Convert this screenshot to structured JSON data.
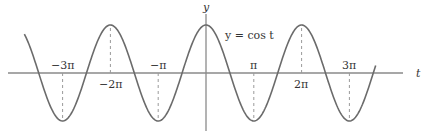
{
  "chart_data": {
    "type": "line",
    "title": "",
    "equation_label": "y = cos t",
    "xlabel": "t",
    "ylabel": "y",
    "function": "cos",
    "x_range_radians": [
      -3.8,
      3.55
    ],
    "ylim": [
      -1,
      1
    ],
    "grid": false,
    "tick_labels_above_axis": [
      {
        "label": "−3π",
        "x_multiple_of_pi": -3
      },
      {
        "label": "−π",
        "x_multiple_of_pi": -1
      },
      {
        "label": "π",
        "x_multiple_of_pi": 1
      },
      {
        "label": "3π",
        "x_multiple_of_pi": 3
      }
    ],
    "tick_labels_below_axis": [
      {
        "label": "−2π",
        "x_multiple_of_pi": -2
      },
      {
        "label": "2π",
        "x_multiple_of_pi": 2
      }
    ],
    "dashed_guides_at_multiple_of_pi": [
      -3,
      -2,
      -1,
      1,
      2,
      3
    ],
    "colors": {
      "curve": "#6b6b6b",
      "axes": "#8a8a8a",
      "text": "#333333"
    }
  },
  "labels": {
    "y_axis": "y",
    "t_axis": "t",
    "equation": "y = cos t",
    "tick_m3pi": "−3π",
    "tick_m2pi": "−2π",
    "tick_mpi": "−π",
    "tick_pi": "π",
    "tick_2pi": "2π",
    "tick_3pi": "3π"
  }
}
